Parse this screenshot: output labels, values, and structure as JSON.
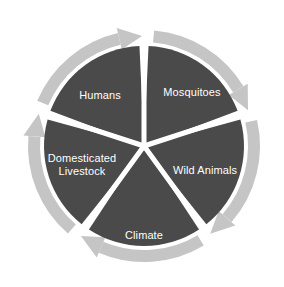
{
  "diagram": {
    "type": "cycle-wheel",
    "segment_count": 5,
    "direction": "clockwise",
    "colors": {
      "segment_fill": "#4a4a4a",
      "ring_band": "#c5c5c5",
      "divider": "#ffffff",
      "label_text": "#ffffff",
      "background": "#ffffff"
    },
    "geometry": {
      "center_x": 144,
      "center_y": 146,
      "disc_radius": 100,
      "ring_outer_radius": 116,
      "ring_inner_radius": 104
    },
    "segments": [
      {
        "id": "mosquitoes",
        "label": "Mosquitoes",
        "label_lines": [
          "Mosquitoes"
        ],
        "start_angle": 0,
        "end_angle": 72,
        "label_x": 192,
        "label_y": 93
      },
      {
        "id": "wild-animals",
        "label": "Wild Animals",
        "label_lines": [
          "Wild Animals"
        ],
        "start_angle": 72,
        "end_angle": 144,
        "label_x": 205,
        "label_y": 171
      },
      {
        "id": "climate",
        "label": "Climate",
        "label_lines": [
          "Climate"
        ],
        "start_angle": 144,
        "end_angle": 216,
        "label_x": 144,
        "label_y": 236
      },
      {
        "id": "domesticated-livestock",
        "label": "Domesticated Livestock",
        "label_lines": [
          "Domesticated",
          "Livestock"
        ],
        "start_angle": 216,
        "end_angle": 288,
        "label_x": 82,
        "label_y": 165
      },
      {
        "id": "humans",
        "label": "Humans",
        "label_lines": [
          "Humans"
        ],
        "start_angle": 288,
        "end_angle": 360,
        "label_x": 100,
        "label_y": 96
      }
    ],
    "arrows": [
      {
        "id": "arrow-top",
        "at_angle": 0,
        "points": "clockwise"
      },
      {
        "id": "arrow-right",
        "at_angle": 72,
        "points": "clockwise"
      },
      {
        "id": "arrow-bottom-right",
        "at_angle": 144,
        "points": "clockwise"
      },
      {
        "id": "arrow-bottom-left",
        "at_angle": 216,
        "points": "clockwise"
      },
      {
        "id": "arrow-left",
        "at_angle": 288,
        "points": "clockwise"
      }
    ]
  }
}
